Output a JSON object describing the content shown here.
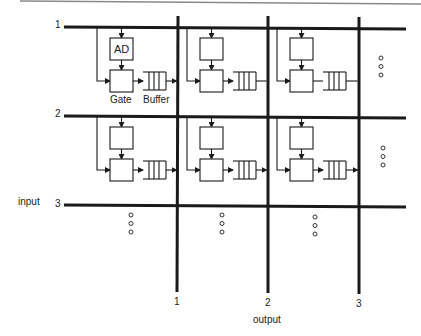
{
  "diagram": {
    "top_rule_color": "#888888",
    "line_color": "#1a1a1a",
    "input_label": "input",
    "output_label": "output",
    "input_lines": [
      {
        "id": "1",
        "label": "1",
        "y": 27
      },
      {
        "id": "2",
        "label": "2",
        "y": 116
      },
      {
        "id": "3",
        "label": "3",
        "y": 205
      }
    ],
    "output_lines": [
      {
        "id": "1",
        "label": "1",
        "x": 178
      },
      {
        "id": "2",
        "label": "2",
        "x": 268
      },
      {
        "id": "3",
        "label": "3",
        "x": 359
      }
    ],
    "block_labels": {
      "ad": "AD",
      "gate": "Gate",
      "buffer": "Buffer"
    },
    "continuation_marker": "o o o"
  }
}
